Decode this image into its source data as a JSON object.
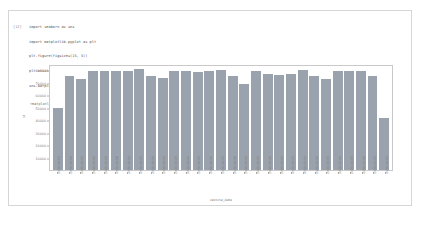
{
  "notebook": {
    "prompt": "[12]",
    "code_lines": [
      "import seaborn as sns",
      "import matplotlib.pyplot as plt",
      "plt.figure(figsize=(15, 5))",
      "plt.xticks(rotation=90)",
      "sns.barplot(x=daily_count[\"vaccine_date\"], y=daily_count[\"id\"])"
    ],
    "output_text": "<matplotlib.axes._subplots.AxesSubplot at 0x7f3a4f0667d0>"
  },
  "colors": {
    "bar": "#9aa3ad",
    "axis": "#c9c9c9",
    "text": "#7a7a7a",
    "cell_border": "#d6d6d6"
  },
  "chart_data": {
    "type": "bar",
    "title": "",
    "xlabel": "vaccine_date",
    "ylabel": "id",
    "ylim": [
      0,
      85000
    ],
    "grid": false,
    "legend": false,
    "yticks": [
      10000,
      20000,
      30000,
      40000,
      50000,
      60000,
      70000,
      80000
    ],
    "ytick_labels": [
      "10000",
      "20000",
      "30000",
      "40000",
      "50000",
      "60000",
      "70000",
      "80000"
    ],
    "categories": [
      "2021-01-13",
      "2021-01-14",
      "2021-01-15",
      "2021-01-16",
      "2021-01-17",
      "2021-01-18",
      "2021-01-19",
      "2021-01-20",
      "2021-01-21",
      "2021-01-22",
      "2021-01-23",
      "2021-01-24",
      "2021-01-25",
      "2021-01-26",
      "2021-01-27",
      "2021-01-28",
      "2021-01-29",
      "2021-01-30",
      "2021-01-31",
      "2021-02-01",
      "2021-02-02",
      "2021-02-03",
      "2021-02-04",
      "2021-02-05",
      "2021-02-06",
      "2021-02-07",
      "2021-02-08",
      "2021-02-09",
      "2021-02-10"
    ],
    "values": [
      50000,
      75000,
      73000,
      79000,
      79000,
      79500,
      79000,
      81000,
      75500,
      73500,
      79000,
      79000,
      78500,
      79500,
      80000,
      75500,
      69000,
      79000,
      77000,
      76000,
      77000,
      80500,
      75000,
      73000,
      79000,
      79000,
      79500,
      75500,
      42000
    ]
  }
}
